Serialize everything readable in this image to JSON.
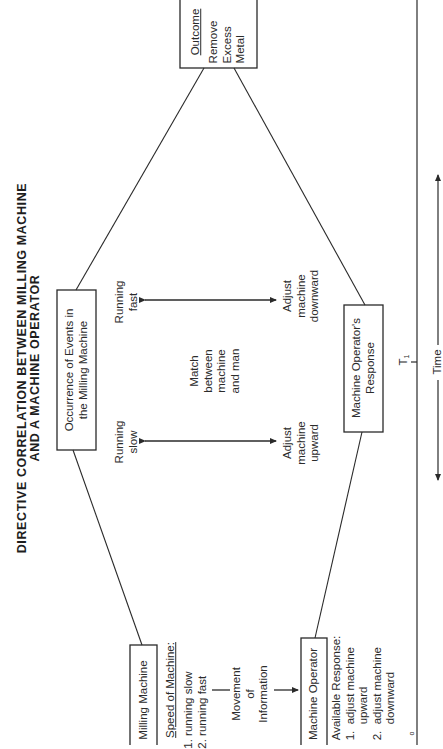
{
  "title": {
    "line1": "DIRECTIVE CORRELATION BETWEEN MILLING MACHINE",
    "line2": "AND A MACHINE OPERATOR"
  },
  "boxes": {
    "outcome": {
      "label": "Outcome",
      "lines": [
        "Remove",
        "Excess",
        "Metal"
      ]
    },
    "occurrence": {
      "line1": "Occurrence of Events in",
      "line2": "the Milling Machine"
    },
    "response": {
      "line1": "Machine Operator's",
      "line2": "Response"
    },
    "milling_machine": {
      "label": "Milling Machine"
    },
    "machine_operator": {
      "label": "Machine Operator"
    }
  },
  "correlations": [
    {
      "machine_state": [
        "Running",
        "fast"
      ],
      "operator_action": [
        "Adjust",
        "machine",
        "downward"
      ]
    },
    {
      "machine_state": [
        "Running",
        "slow"
      ],
      "operator_action": [
        "Adjust",
        "machine",
        "upward"
      ]
    }
  ],
  "match_label": [
    "Match",
    "between",
    "machine",
    "and man"
  ],
  "machine_info": {
    "heading": "Speed of Machine:",
    "items": [
      "1.  running slow",
      "2.  running fast"
    ]
  },
  "movement_label": [
    "Movement",
    "of",
    "Information"
  ],
  "operator_info": {
    "heading": "Available Response:",
    "items": [
      "1.  adjust machine",
      "     upward",
      "2.  adjust machine",
      "     downward"
    ]
  },
  "time_axis": {
    "label": "Time",
    "t0": "T",
    "t0_sub": "o",
    "t1": "T",
    "t1_sub": "1"
  },
  "colors": {
    "line": "#2a2a2a",
    "background": "#ffffff"
  }
}
